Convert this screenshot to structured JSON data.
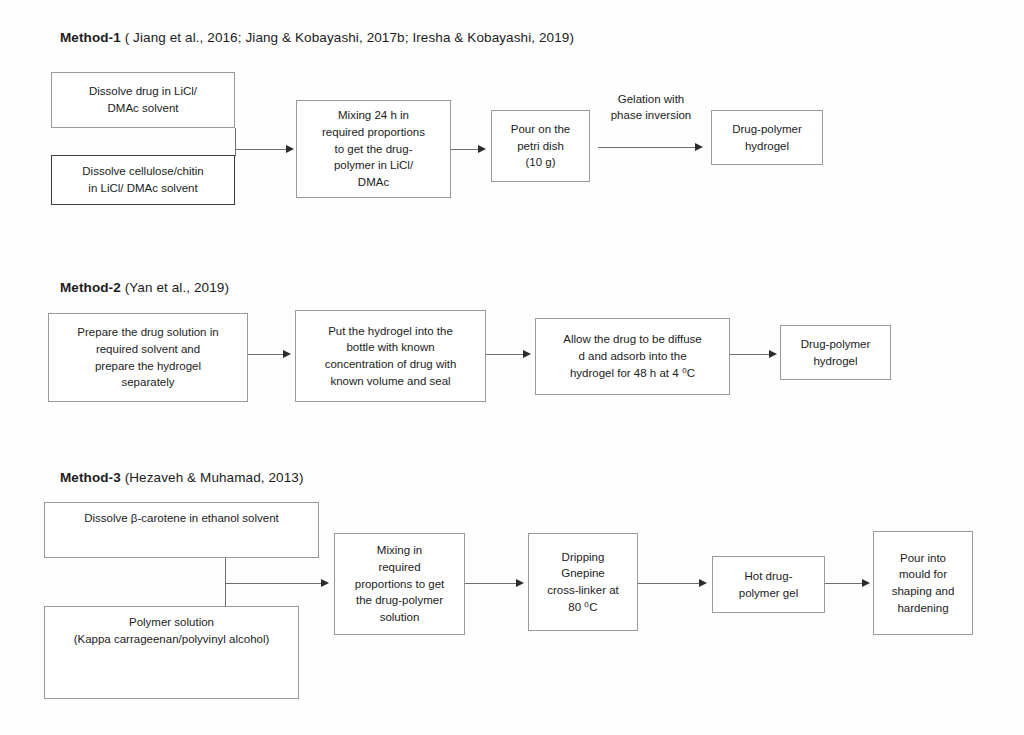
{
  "figure": {
    "background_color": "#fefefe",
    "text_color": "#1c1c1c",
    "border_color": "#9a9a9a",
    "arrow_color": "#2b2b2b"
  },
  "methods": [
    {
      "id": "method-1",
      "label": "Method-1",
      "reference": "( Jiang et al., 2016; Jiang & Kobayashi, 2017b; Iresha & Kobayashi, 2019)",
      "nodes": [
        {
          "id": "m1-n1",
          "text": "Dissolve drug in LiCl/\nDMAc solvent"
        },
        {
          "id": "m1-n2",
          "text": "Dissolve cellulose/chitin\nin LiCl/ DMAc solvent"
        },
        {
          "id": "m1-n3",
          "text": "Mixing 24 h in\nrequired proportions\nto get the drug-\npolymer in LiCl/\nDMAc"
        },
        {
          "id": "m1-n4",
          "text": "Pour on the\npetri dish\n(10 g)"
        },
        {
          "id": "m1-n5",
          "text": "Drug-polymer\nhydrogel"
        }
      ],
      "edge_labels": [
        {
          "id": "m1-e1",
          "text": "Gelation with\nphase inversion"
        }
      ]
    },
    {
      "id": "method-2",
      "label": "Method-2",
      "reference": "(Yan et al., 2019)",
      "nodes": [
        {
          "id": "m2-n1",
          "text": "Prepare the drug solution in\nrequired solvent  and\nprepare the hydrogel\nseparately"
        },
        {
          "id": "m2-n2",
          "text": "Put the hydrogel into the\nbottle with known\nconcentration of drug with\nknown volume and seal"
        },
        {
          "id": "m2-n3",
          "text": "Allow the drug to be diffuse\nd and adsorb into the\nhydrogel for 48 h at 4 ⁰C"
        },
        {
          "id": "m2-n4",
          "text": "Drug-polymer\nhydrogel"
        }
      ],
      "edge_labels": []
    },
    {
      "id": "method-3",
      "label": "Method-3",
      "reference": "(Hezaveh & Muhamad, 2013)",
      "nodes": [
        {
          "id": "m3-n1",
          "text": "Dissolve β-carotene in ethanol solvent"
        },
        {
          "id": "m3-n2",
          "text": "Polymer solution\n(Kappa carrageenan/polyvinyl alcohol)"
        },
        {
          "id": "m3-n3",
          "text": "Mixing in\nrequired\nproportions to get\nthe drug-polymer\nsolution"
        },
        {
          "id": "m3-n4",
          "text": "Dripping\nGnepine\ncross-linker at\n80 ⁰C"
        },
        {
          "id": "m3-n5",
          "text": "Hot drug-\npolymer gel"
        },
        {
          "id": "m3-n6",
          "text": "Pour into\nmould for\nshaping and\nhardening"
        }
      ],
      "edge_labels": []
    }
  ]
}
